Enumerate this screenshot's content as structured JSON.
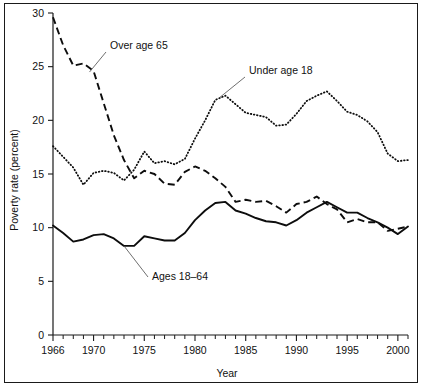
{
  "figure": {
    "background_color": "#ffffff",
    "frame_color": "#1a1a1a",
    "ink_color": "#0d0d0d"
  },
  "chart_data": {
    "type": "line",
    "title": "",
    "xlabel": "Year",
    "ylabel": "Poverty rate (percent)",
    "xlim": [
      1966,
      2001
    ],
    "ylim": [
      0,
      30
    ],
    "xticks": [
      1966,
      1970,
      1975,
      1980,
      1985,
      1990,
      1995,
      2000
    ],
    "xtick_labels": [
      "1966",
      "1970",
      "1975",
      "1980",
      "1985",
      "1990",
      "1995",
      "2000"
    ],
    "xtick_minor_step": 1,
    "yticks": [
      0,
      5,
      10,
      15,
      20,
      25,
      30
    ],
    "ytick_labels": [
      "0",
      "5",
      "10",
      "15",
      "20",
      "25",
      "30"
    ],
    "grid": false,
    "legend": "inline-annotations",
    "x": [
      1966,
      1967,
      1968,
      1969,
      1970,
      1971,
      1972,
      1973,
      1974,
      1975,
      1976,
      1977,
      1978,
      1979,
      1980,
      1981,
      1982,
      1983,
      1984,
      1985,
      1986,
      1987,
      1988,
      1989,
      1990,
      1991,
      1992,
      1993,
      1994,
      1995,
      1996,
      1997,
      1998,
      1999,
      2000,
      2001
    ],
    "series": [
      {
        "name": "Over age 65",
        "style": "dashed",
        "label": "Over age 65",
        "values": [
          29.6,
          27.0,
          25.1,
          25.3,
          24.6,
          21.6,
          18.6,
          16.3,
          14.6,
          15.3,
          15.0,
          14.1,
          14.0,
          15.2,
          15.7,
          15.3,
          14.6,
          13.8,
          12.4,
          12.6,
          12.4,
          12.5,
          12.0,
          11.4,
          12.2,
          12.4,
          12.9,
          12.2,
          11.7,
          10.5,
          10.8,
          10.5,
          10.5,
          9.7,
          9.9,
          10.1
        ],
        "units": "percent"
      },
      {
        "name": "Under age 18",
        "style": "dotted",
        "label": "Under age 18",
        "values": [
          17.6,
          16.6,
          15.6,
          14.0,
          15.1,
          15.3,
          15.1,
          14.4,
          15.4,
          17.1,
          16.0,
          16.2,
          15.9,
          16.4,
          18.3,
          20.0,
          21.9,
          22.3,
          21.5,
          20.7,
          20.5,
          20.3,
          19.5,
          19.6,
          20.6,
          21.8,
          22.3,
          22.7,
          21.8,
          20.8,
          20.5,
          19.9,
          18.9,
          16.9,
          16.2,
          16.3
        ],
        "units": "percent"
      },
      {
        "name": "Ages 18-64",
        "style": "solid",
        "label": "Ages 18–64",
        "values": [
          10.2,
          9.5,
          8.7,
          8.9,
          9.3,
          9.4,
          9.0,
          8.3,
          8.3,
          9.2,
          9.0,
          8.8,
          8.8,
          9.5,
          10.7,
          11.6,
          12.3,
          12.4,
          11.6,
          11.3,
          10.9,
          10.6,
          10.5,
          10.2,
          10.7,
          11.4,
          11.9,
          12.4,
          11.9,
          11.4,
          11.4,
          10.9,
          10.5,
          10.0,
          9.4,
          10.1
        ],
        "units": "percent"
      }
    ],
    "annotations": [
      {
        "name": "over-65-label",
        "text": "Over age 65",
        "points_to_year": 1969.6,
        "points_to_value": 24.5
      },
      {
        "name": "under-18-label",
        "text": "Under age 18",
        "points_to_year": 1982.4,
        "points_to_value": 22.1
      },
      {
        "name": "ages-18-64-label",
        "text": "Ages 18–64",
        "points_to_year": 1973.0,
        "points_to_value": 8.3
      }
    ]
  }
}
